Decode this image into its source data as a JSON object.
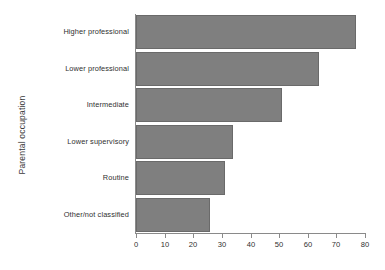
{
  "chart_data": {
    "type": "bar",
    "orientation": "horizontal",
    "title": "",
    "xlabel": "",
    "ylabel": "Parental occupation",
    "categories": [
      "Higher professional",
      "Lower professional",
      "Intermediate",
      "Lower supervisory",
      "Routine",
      "Other/not classified"
    ],
    "values": [
      77,
      64,
      51,
      34,
      31,
      26
    ],
    "xlim": [
      0,
      80
    ],
    "xticks": [
      0,
      10,
      20,
      30,
      40,
      50,
      60,
      70,
      80
    ],
    "xtick_labels": [
      "0",
      "10",
      "20",
      "30",
      "40",
      "50",
      "60",
      "70",
      "80"
    ],
    "grid": false,
    "legend": null,
    "bar_color": "#7f7f7f",
    "bar_edge_color": "#6a6a6a",
    "axis_color": "#8a8a8a",
    "background_color": "#ffffff"
  }
}
